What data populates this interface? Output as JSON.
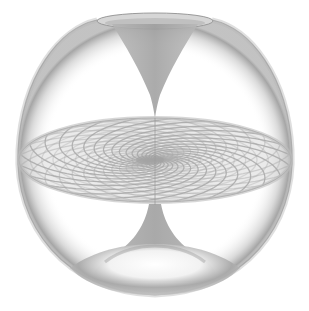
{
  "figure": {
    "colors": {
      "background": "#ffffff",
      "surface": "#9a9a9a",
      "surface_dark": "#7d7d7d",
      "mesh": "#a8a8a8",
      "highlight": "#f4f4f4"
    },
    "geometry": {
      "sphere": {
        "cx": 155,
        "cy": 155,
        "rx": 138,
        "ry": 140
      },
      "top_rim": {
        "cx": 155,
        "cy": 21,
        "rx": 58,
        "ry": 8
      },
      "disk": {
        "cx": 155,
        "cy": 160,
        "rx": 136,
        "ry": 42
      },
      "top_funnel_tip": {
        "x": 155,
        "y": 118
      },
      "bottom_funnel_neck": {
        "x": 155,
        "y": 205
      },
      "spiral_arms": 24,
      "rings": 12
    }
  }
}
